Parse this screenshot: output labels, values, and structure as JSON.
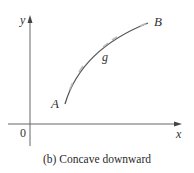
{
  "figure": {
    "caption": "(b) Concave downward",
    "axes": {
      "x_label": "x",
      "y_label": "y",
      "origin_label": "0"
    },
    "curve": {
      "name": "g",
      "start_label": "A",
      "end_label": "B",
      "concavity": "downward"
    },
    "colors": {
      "axis": "#555555",
      "curve": "#555555",
      "tick_marks": "#aaaaaa",
      "text": "#333333"
    }
  }
}
